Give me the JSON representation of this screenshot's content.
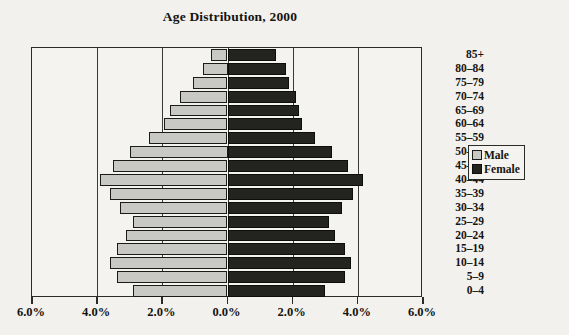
{
  "chart_data": {
    "type": "bar",
    "subtype": "population-pyramid",
    "title": "Age Distribution, 2000",
    "xlabel": "",
    "ylabel": "",
    "xlim": [
      -6.0,
      6.0
    ],
    "grid": true,
    "legend_position": "right",
    "xtick_labels": [
      "6.0%",
      "4.0%",
      "2.0%",
      "0.0%",
      "2.0%",
      "4.0%",
      "6.0%"
    ],
    "xtick_values": [
      -6.0,
      -4.0,
      -2.0,
      0.0,
      2.0,
      4.0,
      6.0
    ],
    "categories": [
      "85+",
      "80–84",
      "75–79",
      "70–74",
      "65–69",
      "60–64",
      "55–59",
      "50–54",
      "45–49",
      "40–44",
      "35–39",
      "30–34",
      "25–29",
      "20–24",
      "15–19",
      "10–14",
      "5–9",
      "0–4"
    ],
    "series": [
      {
        "name": "Male",
        "color": "#c8c8c4",
        "side": "left",
        "values": [
          0.5,
          0.75,
          1.05,
          1.45,
          1.75,
          1.95,
          2.4,
          3.0,
          3.5,
          3.9,
          3.6,
          3.3,
          2.9,
          3.1,
          3.4,
          3.6,
          3.4,
          2.9
        ]
      },
      {
        "name": "Female",
        "color": "#232320",
        "side": "right",
        "values": [
          1.5,
          1.8,
          1.9,
          2.1,
          2.2,
          2.3,
          2.7,
          3.2,
          3.7,
          4.15,
          3.85,
          3.5,
          3.1,
          3.3,
          3.6,
          3.8,
          3.6,
          3.0
        ]
      }
    ]
  },
  "legend": {
    "items": [
      {
        "label": "Male",
        "swatch": "male-swatch"
      },
      {
        "label": "Female",
        "swatch": "female-swatch"
      }
    ]
  }
}
